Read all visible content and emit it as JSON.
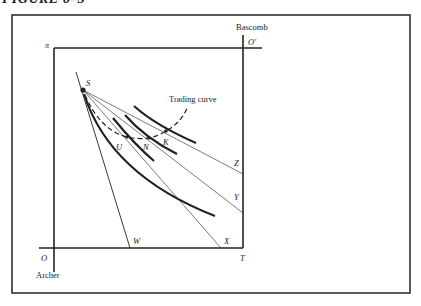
{
  "figure": {
    "title": "FIGURE 6–3",
    "labels": {
      "pi": "π",
      "bascomb": "Bascomb",
      "o_prime": "O′",
      "s": "S",
      "trading_curve": "Trading curve",
      "u": "U",
      "n": "N",
      "k": "K",
      "z": "Z",
      "y": "Y",
      "w": "W",
      "x": "X",
      "o": "O",
      "t": "T",
      "archer": "Archer"
    },
    "colors": {
      "ink": "#222222",
      "background": "#ffffff"
    }
  }
}
